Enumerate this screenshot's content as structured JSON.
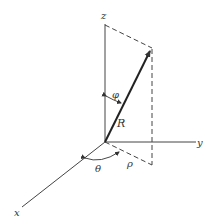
{
  "diagram": {
    "type": "spherical-coordinates",
    "axes": {
      "x": "x",
      "y": "y",
      "z": "z"
    },
    "vector_label": "R",
    "angles": {
      "polar": "φ",
      "azimuth": "θ"
    },
    "projection_label": "ρ",
    "colors": {
      "line": "#333333",
      "background": "#ffffff"
    }
  }
}
